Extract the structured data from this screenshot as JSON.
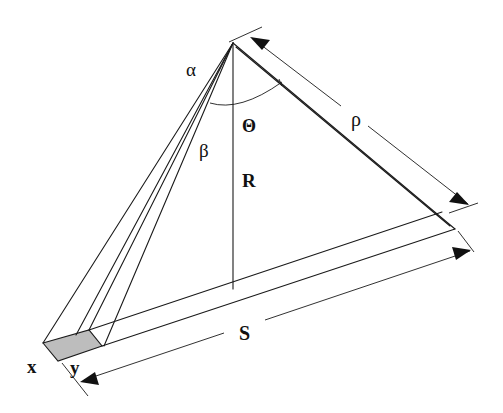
{
  "diagram": {
    "type": "geometry-schematic",
    "labels": {
      "alpha": "α",
      "beta": "β",
      "theta": "Θ",
      "R": "R",
      "rho": "ρ",
      "S": "S",
      "x": "x",
      "y": "y"
    },
    "colors": {
      "line": "#1a1a1a",
      "shaded_element": "#bdbdbd",
      "background": "#ffffff"
    },
    "dimensions": [
      {
        "name": "rho",
        "label": "ρ",
        "from": "apex",
        "to": "far-end of strip"
      },
      {
        "name": "S",
        "label": "S",
        "from": "element near edge",
        "to": "far-end of strip"
      }
    ],
    "angles": [
      {
        "name": "alpha",
        "label": "α"
      },
      {
        "name": "beta",
        "label": "β"
      },
      {
        "name": "theta",
        "label": "Θ"
      }
    ]
  }
}
